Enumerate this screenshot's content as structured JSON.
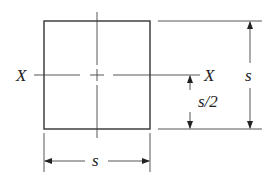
{
  "diagram": {
    "type": "square cross-section with centroidal axis",
    "stroke_color": "#333333",
    "axis_label_left": "X",
    "axis_label_right": "X",
    "dim_height_label": "s",
    "dim_half_height_label": "s/2",
    "dim_width_label": "s"
  }
}
